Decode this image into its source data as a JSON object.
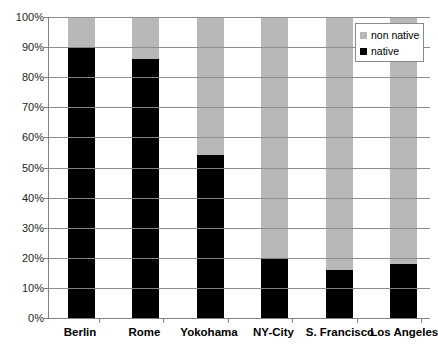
{
  "chart_data": {
    "type": "bar",
    "subtype": "stacked-percent",
    "title": "",
    "xlabel": "",
    "ylabel": "",
    "ylim": [
      0,
      100
    ],
    "ytick_labels": [
      "100%",
      "90%",
      "80%",
      "70%",
      "60%",
      "50%",
      "40%",
      "30%",
      "20%",
      "10%",
      "0%"
    ],
    "ytick_values": [
      100,
      90,
      80,
      70,
      60,
      50,
      40,
      30,
      20,
      10,
      0
    ],
    "grid": true,
    "legend_position": "top-right",
    "categories": [
      "Berlin",
      "Rome",
      "Yokohama",
      "NY-City",
      "S. Francisco",
      "Los Angeles"
    ],
    "series": [
      {
        "name": "native",
        "color": "#000000",
        "values": [
          90,
          86,
          54,
          20,
          16,
          18
        ]
      },
      {
        "name": "non native",
        "color": "#b8b8b8",
        "values": [
          10,
          14,
          46,
          80,
          84,
          82
        ]
      }
    ]
  },
  "legend": {
    "entries": [
      {
        "label": "non native",
        "color": "#b8b8b8"
      },
      {
        "label": "native",
        "color": "#000000"
      }
    ]
  },
  "colors": {
    "native": "#000000",
    "non_native": "#b8b8b8",
    "axis": "#808080",
    "grid": "#9a9a9a",
    "background": "#ffffff"
  }
}
